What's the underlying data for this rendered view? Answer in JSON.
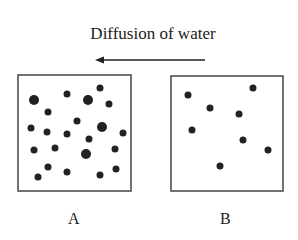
{
  "title": "Diffusion of water",
  "arrow": {
    "direction": "left",
    "x1": 205,
    "x2": 95,
    "y": 60
  },
  "colors": {
    "ink": "#222222",
    "frame": "#444444",
    "background": "#ffffff"
  },
  "containers": [
    {
      "label": "A",
      "frame": {
        "x": 18,
        "y": 75,
        "w": 113,
        "h": 116
      },
      "particles": [
        [
          34,
          100,
          5
        ],
        [
          67,
          94,
          3.5
        ],
        [
          88,
          100,
          5
        ],
        [
          100,
          88,
          3.5
        ],
        [
          109,
          104,
          3.5
        ],
        [
          48,
          112,
          3.5
        ],
        [
          77,
          121,
          3.5
        ],
        [
          31,
          128,
          3.5
        ],
        [
          47,
          132,
          3.5
        ],
        [
          67,
          134,
          3.5
        ],
        [
          102,
          127,
          5
        ],
        [
          123,
          133,
          3.5
        ],
        [
          89,
          139,
          3.5
        ],
        [
          34,
          150,
          3.5
        ],
        [
          55,
          148,
          3.5
        ],
        [
          86,
          154,
          5
        ],
        [
          115,
          149,
          3.5
        ],
        [
          48,
          167,
          3.5
        ],
        [
          67,
          172,
          3.5
        ],
        [
          100,
          175,
          3.5
        ],
        [
          116,
          169,
          3.5
        ],
        [
          38,
          177,
          3.5
        ]
      ]
    },
    {
      "label": "B",
      "frame": {
        "x": 171,
        "y": 76,
        "w": 112,
        "h": 115
      },
      "particles": [
        [
          188,
          95,
          3.5
        ],
        [
          253,
          88,
          3.5
        ],
        [
          210,
          108,
          3.5
        ],
        [
          239,
          114,
          3.5
        ],
        [
          192,
          130,
          3.5
        ],
        [
          243,
          140,
          3.5
        ],
        [
          268,
          150,
          3.5
        ],
        [
          220,
          166,
          3.5
        ]
      ]
    }
  ]
}
